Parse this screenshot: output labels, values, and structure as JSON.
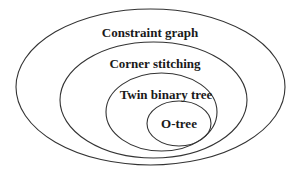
{
  "diagram": {
    "type": "nested-ellipses",
    "stroke_color": "#333333",
    "text_color": "#1a1a1a",
    "sets": [
      {
        "label": "Constraint graph",
        "level": 0
      },
      {
        "label": "Corner stitching",
        "level": 1
      },
      {
        "label": "Twin binary tree",
        "level": 2
      },
      {
        "label": "O-tree",
        "level": 3
      }
    ]
  }
}
